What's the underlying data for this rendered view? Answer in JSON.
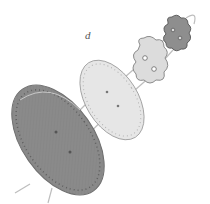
{
  "figure": {
    "panel_label": "d",
    "parts": [
      {
        "name": "large-dark-disc",
        "color": "#8a8a8a"
      },
      {
        "name": "light-disc",
        "color": "#e6e6e6"
      },
      {
        "name": "light-flower-button",
        "color": "#e2e2e2"
      },
      {
        "name": "dark-flower-button",
        "color": "#8e8e8e"
      }
    ],
    "thread_color": "#bdbdbd",
    "outline_color": "#6f6f6f"
  }
}
